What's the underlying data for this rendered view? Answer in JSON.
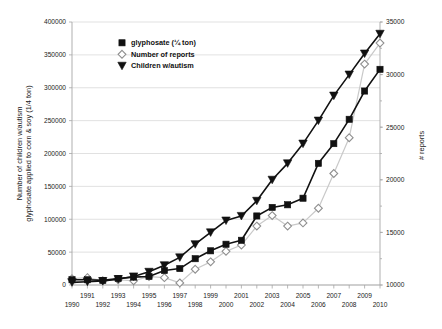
{
  "chart_data": {
    "type": "line",
    "title": "",
    "xlabel": "",
    "ylabel": "Number of children w/autism\nglyphosate applied to corn & soy (1/4 ton)",
    "ylabel_line1": "Number of children w/autism",
    "ylabel_line2": "glyphosate applied to corn & soy (1/4 ton)",
    "y2label": "# reports",
    "x": [
      1990,
      1991,
      1992,
      1993,
      1994,
      1995,
      1996,
      1997,
      1998,
      1999,
      2000,
      2001,
      2002,
      2003,
      2004,
      2005,
      2006,
      2007,
      2008,
      2009,
      2010
    ],
    "xlim": [
      1990,
      2010
    ],
    "ylim": [
      0,
      400000
    ],
    "y2lim": [
      10000,
      35000
    ],
    "yticks": [
      0,
      50000,
      100000,
      150000,
      200000,
      250000,
      300000,
      350000,
      400000
    ],
    "ytick_labels": [
      "0",
      "50000",
      "100000",
      "150000",
      "200000",
      "250000",
      "300000",
      "350000",
      "400000"
    ],
    "y2ticks": [
      10000,
      15000,
      20000,
      25000,
      30000,
      35000
    ],
    "y2tick_labels": [
      "10000",
      "15000",
      "20000",
      "25000",
      "30000",
      "35000"
    ],
    "xtick_labels_upper": [
      "1991",
      "1993",
      "1995",
      "1997",
      "1999",
      "2001",
      "2003",
      "2005",
      "2007",
      "2009"
    ],
    "xtick_labels_lower": [
      "1990",
      "1992",
      "1994",
      "1996",
      "1998",
      "2000",
      "2002",
      "2004",
      "2006",
      "2008",
      "2010"
    ],
    "grid": true,
    "legend_position": "top-center",
    "series": [
      {
        "name": "glyphosate (¼ ton)",
        "marker": "filled-square",
        "color": "#111111",
        "axis": "left",
        "values": [
          8000,
          8000,
          7000,
          10000,
          12000,
          13000,
          22000,
          25000,
          40000,
          52000,
          62000,
          68000,
          105000,
          118000,
          122000,
          132000,
          185000,
          215000,
          252000,
          295000,
          328000
        ]
      },
      {
        "name": "Number of reports",
        "marker": "open-diamond",
        "color": "#c9c9c9",
        "axis": "right",
        "values": [
          10600,
          10700,
          10400,
          10500,
          10400,
          10800,
          10700,
          10200,
          11500,
          12200,
          13200,
          13800,
          15600,
          16600,
          15600,
          15900,
          17300,
          20600,
          24000,
          31000,
          33000
        ]
      },
      {
        "name": "Children w/autism",
        "marker": "filled-triangle-down",
        "color": "#111111",
        "axis": "left",
        "values": [
          4000,
          5000,
          6000,
          9000,
          13000,
          20000,
          30000,
          42000,
          62000,
          80000,
          98000,
          105000,
          128000,
          160000,
          185000,
          215000,
          250000,
          288000,
          320000,
          352000,
          382000
        ]
      }
    ]
  },
  "legend": {
    "items": [
      {
        "label": "glyphosate (¼ ton)"
      },
      {
        "label": "Number of reports"
      },
      {
        "label": "Children w/autism"
      }
    ]
  }
}
